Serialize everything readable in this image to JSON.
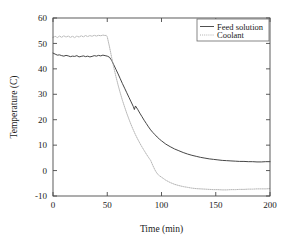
{
  "chart_data": {
    "type": "line",
    "title": "",
    "xlabel": "Time (min)",
    "ylabel": "Temperature (C)",
    "xlim": [
      0,
      200
    ],
    "ylim": [
      -10,
      60
    ],
    "xticks": [
      0,
      50,
      100,
      150,
      200
    ],
    "yticks": [
      -10,
      0,
      10,
      20,
      30,
      40,
      50,
      60
    ],
    "grid": false,
    "legend_position": "top-right",
    "legend_entries": [
      "Feed solution",
      "Coolant"
    ],
    "series": [
      {
        "name": "Feed solution",
        "style": "solid",
        "color": "#3c3c3c",
        "x": [
          0,
          2,
          4,
          6,
          8,
          10,
          12,
          14,
          16,
          18,
          20,
          22,
          24,
          26,
          28,
          30,
          32,
          34,
          36,
          38,
          40,
          42,
          44,
          46,
          48,
          50,
          52,
          54,
          56,
          58,
          60,
          62,
          64,
          66,
          68,
          70,
          72,
          74,
          75,
          76,
          78,
          80,
          82,
          84,
          86,
          88,
          90,
          92,
          94,
          96,
          98,
          100,
          104,
          108,
          112,
          116,
          120,
          124,
          128,
          132,
          136,
          140,
          144,
          148,
          152,
          156,
          160,
          164,
          168,
          172,
          176,
          180,
          184,
          188,
          192,
          196,
          200
        ],
        "y": [
          46.2,
          45.8,
          45.4,
          45.5,
          45.2,
          45.0,
          45.3,
          45.1,
          44.8,
          45.0,
          44.9,
          45.2,
          44.7,
          44.9,
          45.1,
          44.8,
          45.0,
          44.7,
          44.9,
          45.2,
          45.0,
          45.3,
          45.1,
          45.4,
          45.2,
          45.0,
          44.6,
          43.4,
          41.6,
          39.8,
          38.0,
          36.1,
          34.2,
          32.4,
          30.6,
          28.8,
          27.0,
          25.2,
          24.0,
          25.4,
          24.1,
          22.6,
          21.2,
          19.8,
          18.5,
          17.2,
          16.0,
          15.0,
          14.1,
          13.2,
          12.4,
          11.7,
          10.4,
          9.4,
          8.5,
          7.8,
          7.1,
          6.5,
          6.0,
          5.6,
          5.2,
          4.9,
          4.6,
          4.4,
          4.2,
          4.0,
          3.9,
          3.8,
          3.7,
          3.6,
          3.6,
          3.5,
          3.5,
          3.4,
          3.4,
          3.5,
          3.5
        ]
      },
      {
        "name": "Coolant",
        "style": "dotted",
        "color": "#a8a8a8",
        "x": [
          0,
          2,
          4,
          6,
          8,
          10,
          12,
          14,
          16,
          18,
          20,
          22,
          24,
          26,
          28,
          30,
          32,
          34,
          36,
          38,
          40,
          42,
          44,
          46,
          48,
          49,
          50,
          52,
          54,
          56,
          58,
          60,
          62,
          64,
          66,
          68,
          70,
          72,
          74,
          76,
          78,
          80,
          82,
          84,
          86,
          88,
          90,
          92,
          94,
          96,
          98,
          100,
          104,
          108,
          112,
          116,
          120,
          124,
          128,
          132,
          136,
          140,
          144,
          148,
          152,
          156,
          160,
          164,
          168,
          172,
          176,
          180,
          184,
          188,
          192,
          196,
          200
        ],
        "y": [
          52.4,
          52.8,
          52.3,
          52.9,
          52.4,
          53.0,
          52.5,
          52.9,
          52.4,
          52.8,
          52.3,
          52.9,
          52.5,
          53.0,
          52.6,
          53.1,
          52.7,
          53.1,
          52.8,
          53.2,
          52.9,
          53.2,
          53.0,
          53.3,
          53.1,
          53.2,
          52.6,
          48.8,
          44.6,
          40.6,
          37.0,
          33.6,
          30.5,
          27.6,
          25.0,
          22.5,
          20.2,
          18.0,
          16.0,
          14.1,
          12.4,
          10.8,
          9.3,
          7.9,
          6.5,
          5.2,
          4.0,
          2.0,
          0.2,
          -1.2,
          -2.0,
          -2.6,
          -3.8,
          -4.7,
          -5.4,
          -5.9,
          -6.3,
          -6.6,
          -6.9,
          -7.1,
          -7.2,
          -7.3,
          -7.4,
          -7.5,
          -7.5,
          -7.6,
          -7.6,
          -7.5,
          -7.5,
          -7.4,
          -7.4,
          -7.3,
          -7.3,
          -7.2,
          -7.2,
          -7.2,
          -7.1
        ]
      }
    ]
  }
}
